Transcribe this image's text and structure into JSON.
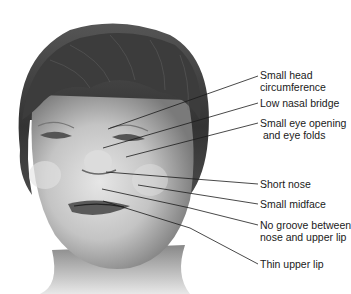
{
  "figure": {
    "colors": {
      "background": "#ffffff",
      "hair": "#3a3a3a",
      "skin_light": "#d8d8d8",
      "skin_mid": "#a8a8a8",
      "skin_dark": "#6a6a6a",
      "line": "#1a1a1a"
    },
    "labels": [
      {
        "id": "small-head-circumference",
        "text": "Small head\ncircumference",
        "y": 69,
        "line": {
          "x1": 108,
          "y1": 129,
          "x2": 258,
          "y2": 76
        }
      },
      {
        "id": "low-nasal-bridge",
        "text": "Low nasal bridge",
        "y": 97,
        "line": {
          "x1": 103,
          "y1": 148,
          "x2": 258,
          "y2": 103
        }
      },
      {
        "id": "small-eye-opening-eye-folds",
        "text": "Small eye opening\n and eye folds",
        "y": 117,
        "line": {
          "x1": 126,
          "y1": 157,
          "x2": 258,
          "y2": 123
        }
      },
      {
        "id": "short-nose",
        "text": "Short nose",
        "y": 178,
        "line": {
          "x1": 106,
          "y1": 172,
          "x2": 258,
          "y2": 184
        }
      },
      {
        "id": "small-midface",
        "text": "Small midface",
        "y": 198,
        "line": {
          "x1": 138,
          "y1": 185,
          "x2": 258,
          "y2": 204
        }
      },
      {
        "id": "no-groove-nose-upper-lip",
        "text": "No groove between\nnose and upper lip",
        "y": 219,
        "line": {
          "points": "102,189 190,208 258,225"
        }
      },
      {
        "id": "thin-upper-lip",
        "text": "Thin upper lip",
        "y": 258,
        "line": {
          "points": "103,201 190,228 258,264"
        }
      }
    ]
  }
}
